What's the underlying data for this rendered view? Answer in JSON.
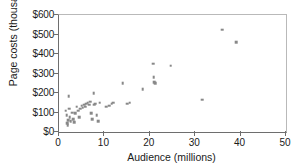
{
  "chart_data": {
    "type": "scatter",
    "title": "",
    "xlabel": "Audience (millions)",
    "ylabel": "Page costs (thousands)",
    "xlim": [
      0,
      50
    ],
    "ylim": [
      0,
      600
    ],
    "xticks": [
      0,
      10,
      20,
      30,
      40,
      50
    ],
    "yticks": [
      0,
      100,
      200,
      300,
      400,
      500,
      600
    ],
    "xticklabels": [
      "0",
      "10",
      "20",
      "30",
      "40",
      "50"
    ],
    "yticklabels": [
      "$0",
      "$100",
      "$200",
      "$300",
      "$400",
      "$500",
      "$600"
    ],
    "grid": false,
    "legend": null,
    "marker": {
      "shape": "square",
      "color": "#888888",
      "size_px": 2.6
    },
    "axis_color": "#6e6e6e",
    "background": "#ffffff",
    "points": [
      [
        1.5,
        110
      ],
      [
        1.7,
        85
      ],
      [
        1.8,
        45
      ],
      [
        1.9,
        35
      ],
      [
        2.0,
        60
      ],
      [
        2.1,
        185
      ],
      [
        2.3,
        120
      ],
      [
        2.4,
        75
      ],
      [
        2.6,
        55
      ],
      [
        2.9,
        100
      ],
      [
        3.1,
        65
      ],
      [
        3.4,
        50
      ],
      [
        3.6,
        95
      ],
      [
        3.9,
        130
      ],
      [
        4.2,
        110
      ],
      [
        4.4,
        75
      ],
      [
        4.7,
        120
      ],
      [
        5.0,
        135
      ],
      [
        5.2,
        125
      ],
      [
        5.5,
        140
      ],
      [
        5.8,
        130
      ],
      [
        6.0,
        145
      ],
      [
        6.3,
        150
      ],
      [
        6.6,
        140
      ],
      [
        6.9,
        155
      ],
      [
        7.1,
        95
      ],
      [
        7.3,
        65
      ],
      [
        7.6,
        200
      ],
      [
        7.8,
        140
      ],
      [
        8.0,
        145
      ],
      [
        8.3,
        85
      ],
      [
        8.6,
        55
      ],
      [
        9.0,
        150
      ],
      [
        10.4,
        130
      ],
      [
        11.0,
        135
      ],
      [
        11.6,
        145
      ],
      [
        12.0,
        150
      ],
      [
        14.0,
        250
      ],
      [
        15.0,
        145
      ],
      [
        15.6,
        150
      ],
      [
        18.4,
        220
      ],
      [
        20.7,
        350
      ],
      [
        20.9,
        280
      ],
      [
        21.0,
        255
      ],
      [
        21.2,
        250
      ],
      [
        24.6,
        340
      ],
      [
        31.6,
        165
      ],
      [
        36.0,
        525
      ],
      [
        39.0,
        460
      ]
    ]
  }
}
